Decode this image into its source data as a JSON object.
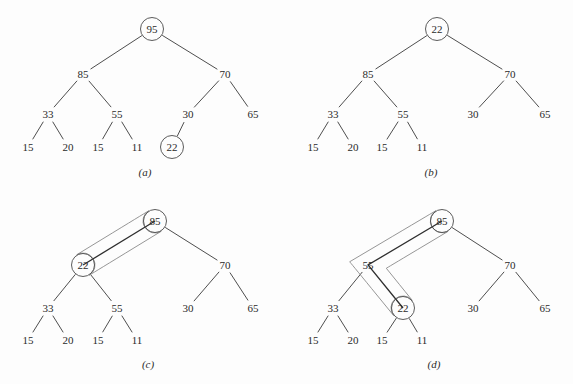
{
  "figure": {
    "background_color": "#fdfdfd",
    "stroke_color": "#3a3a3a",
    "highlight_color": "#8a8a8a",
    "panels": [
      {
        "id": "a",
        "caption": "(a)",
        "caption_pos": [
          145,
          172
        ],
        "nodes": [
          {
            "id": "a-95",
            "label": "95",
            "x": 152,
            "y": 29,
            "circled": true,
            "highlight": false
          },
          {
            "id": "a-85",
            "label": "85",
            "x": 83,
            "y": 74,
            "circled": false,
            "highlight": false
          },
          {
            "id": "a-70",
            "label": "70",
            "x": 225,
            "y": 74,
            "circled": false,
            "highlight": false
          },
          {
            "id": "a-33",
            "label": "33",
            "x": 48,
            "y": 114,
            "circled": false,
            "highlight": false
          },
          {
            "id": "a-55",
            "label": "55",
            "x": 117,
            "y": 114,
            "circled": false,
            "highlight": false
          },
          {
            "id": "a-30",
            "label": "30",
            "x": 188,
            "y": 114,
            "circled": false,
            "highlight": false
          },
          {
            "id": "a-65",
            "label": "65",
            "x": 253,
            "y": 114,
            "circled": false,
            "highlight": false
          },
          {
            "id": "a-15a",
            "label": "15",
            "x": 28,
            "y": 147,
            "circled": false,
            "highlight": false
          },
          {
            "id": "a-20",
            "label": "20",
            "x": 68,
            "y": 147,
            "circled": false,
            "highlight": false
          },
          {
            "id": "a-15b",
            "label": "15",
            "x": 98,
            "y": 147,
            "circled": false,
            "highlight": false
          },
          {
            "id": "a-11",
            "label": "11",
            "x": 137,
            "y": 147,
            "circled": false,
            "highlight": false
          },
          {
            "id": "a-22",
            "label": "22",
            "x": 172,
            "y": 147,
            "circled": true,
            "highlight": false
          }
        ],
        "edges": [
          [
            "a-95",
            "a-85"
          ],
          [
            "a-95",
            "a-70"
          ],
          [
            "a-85",
            "a-33"
          ],
          [
            "a-85",
            "a-55"
          ],
          [
            "a-70",
            "a-30"
          ],
          [
            "a-70",
            "a-65"
          ],
          [
            "a-33",
            "a-15a"
          ],
          [
            "a-33",
            "a-20"
          ],
          [
            "a-55",
            "a-15b"
          ],
          [
            "a-55",
            "a-11"
          ],
          [
            "a-30",
            "a-22"
          ]
        ],
        "capsule": null
      },
      {
        "id": "b",
        "caption": "(b)",
        "caption_pos": [
          431,
          172
        ],
        "nodes": [
          {
            "id": "b-22",
            "label": "22",
            "x": 437,
            "y": 29,
            "circled": true,
            "highlight": false
          },
          {
            "id": "b-85",
            "label": "85",
            "x": 368,
            "y": 74,
            "circled": false,
            "highlight": false
          },
          {
            "id": "b-70",
            "label": "70",
            "x": 510,
            "y": 74,
            "circled": false,
            "highlight": false
          },
          {
            "id": "b-33",
            "label": "33",
            "x": 333,
            "y": 114,
            "circled": false,
            "highlight": false
          },
          {
            "id": "b-55",
            "label": "55",
            "x": 403,
            "y": 114,
            "circled": false,
            "highlight": false
          },
          {
            "id": "b-30",
            "label": "30",
            "x": 473,
            "y": 114,
            "circled": false,
            "highlight": false
          },
          {
            "id": "b-65",
            "label": "65",
            "x": 545,
            "y": 114,
            "circled": false,
            "highlight": false
          },
          {
            "id": "b-15a",
            "label": "15",
            "x": 313,
            "y": 147,
            "circled": false,
            "highlight": false
          },
          {
            "id": "b-20",
            "label": "20",
            "x": 353,
            "y": 147,
            "circled": false,
            "highlight": false
          },
          {
            "id": "b-15b",
            "label": "15",
            "x": 382,
            "y": 147,
            "circled": false,
            "highlight": false
          },
          {
            "id": "b-11",
            "label": "11",
            "x": 422,
            "y": 147,
            "circled": false,
            "highlight": false
          }
        ],
        "edges": [
          [
            "b-22",
            "b-85"
          ],
          [
            "b-22",
            "b-70"
          ],
          [
            "b-85",
            "b-33"
          ],
          [
            "b-85",
            "b-55"
          ],
          [
            "b-70",
            "b-30"
          ],
          [
            "b-70",
            "b-65"
          ],
          [
            "b-33",
            "b-15a"
          ],
          [
            "b-33",
            "b-20"
          ],
          [
            "b-55",
            "b-15b"
          ],
          [
            "b-55",
            "b-11"
          ]
        ],
        "capsule": null
      },
      {
        "id": "c",
        "caption": "(c)",
        "caption_pos": [
          148,
          364
        ],
        "nodes": [
          {
            "id": "c-85",
            "label": "85",
            "x": 155,
            "y": 221,
            "circled": true,
            "highlight": true
          },
          {
            "id": "c-22",
            "label": "22",
            "x": 83,
            "y": 265,
            "circled": true,
            "highlight": true
          },
          {
            "id": "c-70",
            "label": "70",
            "x": 225,
            "y": 265,
            "circled": false,
            "highlight": false
          },
          {
            "id": "c-33",
            "label": "33",
            "x": 48,
            "y": 308,
            "circled": false,
            "highlight": false
          },
          {
            "id": "c-55",
            "label": "55",
            "x": 117,
            "y": 308,
            "circled": false,
            "highlight": false
          },
          {
            "id": "c-30",
            "label": "30",
            "x": 188,
            "y": 308,
            "circled": false,
            "highlight": false
          },
          {
            "id": "c-65",
            "label": "65",
            "x": 253,
            "y": 308,
            "circled": false,
            "highlight": false
          },
          {
            "id": "c-15a",
            "label": "15",
            "x": 28,
            "y": 340,
            "circled": false,
            "highlight": false
          },
          {
            "id": "c-20",
            "label": "20",
            "x": 68,
            "y": 340,
            "circled": false,
            "highlight": false
          },
          {
            "id": "c-15b",
            "label": "15",
            "x": 98,
            "y": 340,
            "circled": false,
            "highlight": false
          },
          {
            "id": "c-11",
            "label": "11",
            "x": 137,
            "y": 340,
            "circled": false,
            "highlight": false
          }
        ],
        "edges": [
          [
            "c-85",
            "c-70"
          ],
          [
            "c-22",
            "c-33"
          ],
          [
            "c-22",
            "c-55"
          ],
          [
            "c-70",
            "c-30"
          ],
          [
            "c-70",
            "c-65"
          ],
          [
            "c-33",
            "c-15a"
          ],
          [
            "c-33",
            "c-20"
          ],
          [
            "c-55",
            "c-15b"
          ],
          [
            "c-55",
            "c-11"
          ]
        ],
        "capsule": {
          "type": "swap-path",
          "path_nodes": [
            "c-22",
            "c-85"
          ],
          "description": "rounded outline enclosing 22 and 85 showing the swap path"
        }
      },
      {
        "id": "d",
        "caption": "(d)",
        "caption_pos": [
          434,
          364
        ],
        "nodes": [
          {
            "id": "d-85",
            "label": "85",
            "x": 442,
            "y": 221,
            "circled": true,
            "highlight": true
          },
          {
            "id": "d-55",
            "label": "55",
            "x": 368,
            "y": 265,
            "circled": false,
            "highlight": true
          },
          {
            "id": "d-70",
            "label": "70",
            "x": 510,
            "y": 265,
            "circled": false,
            "highlight": false
          },
          {
            "id": "d-33",
            "label": "33",
            "x": 333,
            "y": 308,
            "circled": false,
            "highlight": false
          },
          {
            "id": "d-22",
            "label": "22",
            "x": 403,
            "y": 308,
            "circled": true,
            "highlight": true
          },
          {
            "id": "d-30",
            "label": "30",
            "x": 473,
            "y": 308,
            "circled": false,
            "highlight": false
          },
          {
            "id": "d-65",
            "label": "65",
            "x": 545,
            "y": 308,
            "circled": false,
            "highlight": false
          },
          {
            "id": "d-15a",
            "label": "15",
            "x": 313,
            "y": 340,
            "circled": false,
            "highlight": false
          },
          {
            "id": "d-20",
            "label": "20",
            "x": 353,
            "y": 340,
            "circled": false,
            "highlight": false
          },
          {
            "id": "d-15b",
            "label": "15",
            "x": 382,
            "y": 340,
            "circled": false,
            "highlight": false
          },
          {
            "id": "d-11",
            "label": "11",
            "x": 422,
            "y": 340,
            "circled": false,
            "highlight": false
          }
        ],
        "edges": [
          [
            "d-85",
            "d-70"
          ],
          [
            "d-55",
            "d-33"
          ],
          [
            "d-70",
            "d-30"
          ],
          [
            "d-70",
            "d-65"
          ],
          [
            "d-33",
            "d-15a"
          ],
          [
            "d-33",
            "d-20"
          ],
          [
            "d-22",
            "d-15b"
          ],
          [
            "d-22",
            "d-11"
          ]
        ],
        "capsule": {
          "type": "swap-path",
          "path_nodes": [
            "d-22",
            "d-55",
            "d-85"
          ],
          "description": "V-shaped rounded outline enclosing 22, 55 and 85 showing the sift-down path"
        }
      }
    ]
  }
}
